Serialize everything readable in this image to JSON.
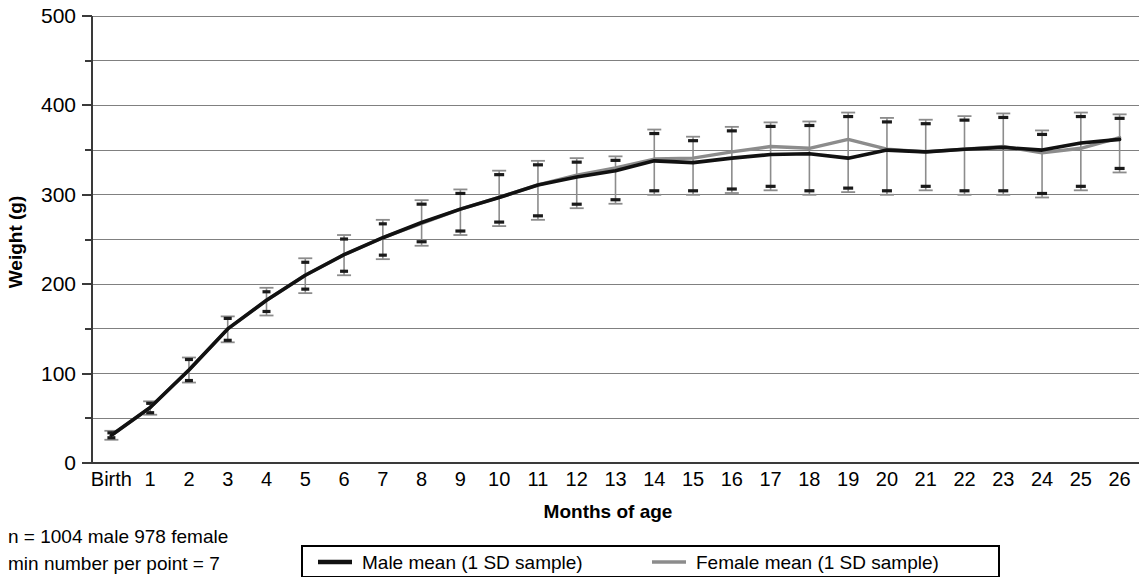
{
  "chart_data": {
    "type": "line",
    "title": "",
    "xlabel": "Months of age",
    "ylabel": "Weight (g)",
    "ylim": [
      0,
      500
    ],
    "yticks": [
      0,
      100,
      200,
      300,
      400,
      500
    ],
    "y_minor_gridlines": [
      50,
      150,
      250,
      350,
      450
    ],
    "grid": true,
    "legend_position": "bottom",
    "categories": [
      "Birth",
      "1",
      "2",
      "3",
      "4",
      "5",
      "6",
      "7",
      "8",
      "9",
      "10",
      "11",
      "12",
      "13",
      "14",
      "15",
      "16",
      "17",
      "18",
      "19",
      "20",
      "21",
      "22",
      "23",
      "24",
      "25",
      "26"
    ],
    "series": [
      {
        "name": "Male mean (1 SD sample)",
        "color": "#111111",
        "values": [
          31,
          62,
          104,
          150,
          182,
          210,
          233,
          252,
          269,
          284,
          297,
          311,
          320,
          327,
          338,
          336,
          341,
          345,
          346,
          341,
          350,
          348,
          351,
          353,
          350,
          358,
          362
        ],
        "sd_lower": [
          26,
          54,
          90,
          135,
          165,
          190,
          210,
          228,
          243,
          255,
          265,
          272,
          285,
          290,
          300,
          300,
          302,
          305,
          300,
          303,
          300,
          305,
          300,
          300,
          297,
          305,
          325
        ],
        "sd_upper": [
          36,
          69,
          118,
          164,
          196,
          229,
          255,
          272,
          294,
          306,
          327,
          338,
          341,
          343,
          373,
          365,
          376,
          381,
          382,
          392,
          386,
          384,
          388,
          391,
          372,
          392,
          390
        ]
      },
      {
        "name": "Female mean (1 SD sample)",
        "color": "#8c8c8c",
        "values": [
          31,
          62,
          104,
          150,
          182,
          210,
          233,
          252,
          268,
          284,
          297,
          311,
          322,
          330,
          340,
          341,
          348,
          354,
          352,
          362,
          351,
          348,
          351,
          354,
          347,
          352,
          364
        ],
        "sd_lower": [
          26,
          54,
          90,
          135,
          165,
          190,
          210,
          228,
          243,
          255,
          265,
          272,
          285,
          290,
          300,
          300,
          302,
          305,
          300,
          303,
          300,
          305,
          300,
          300,
          297,
          305,
          325
        ],
        "sd_upper": [
          36,
          69,
          118,
          164,
          196,
          229,
          255,
          272,
          294,
          306,
          327,
          338,
          341,
          343,
          373,
          365,
          376,
          381,
          382,
          392,
          386,
          384,
          388,
          391,
          372,
          392,
          390
        ]
      }
    ]
  },
  "axes": {
    "y_title": "Weight (g)",
    "x_title": "Months of age",
    "y_tick_labels": [
      "500",
      "400",
      "300",
      "200",
      "100",
      "0"
    ],
    "x_tick_labels": [
      "Birth",
      "1",
      "2",
      "3",
      "4",
      "5",
      "6",
      "7",
      "8",
      "9",
      "10",
      "11",
      "12",
      "13",
      "14",
      "15",
      "16",
      "17",
      "18",
      "19",
      "20",
      "21",
      "22",
      "23",
      "24",
      "25",
      "26"
    ]
  },
  "legend": {
    "items": [
      {
        "label": "Male mean (1 SD sample)",
        "color": "#111111"
      },
      {
        "label": "Female mean (1 SD sample)",
        "color": "#8c8c8c"
      }
    ]
  },
  "footnote": {
    "line1": "n = 1004 male 978 female",
    "line2": "min number per point = 7"
  }
}
